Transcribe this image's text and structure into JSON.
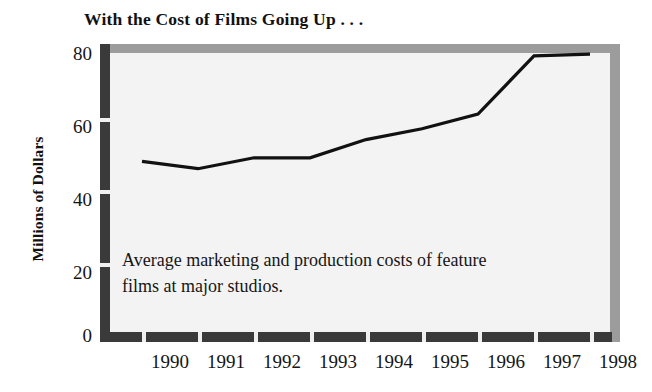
{
  "title": "With the Cost of Films Going Up . . .",
  "axis": {
    "y_title": "Millions of Dollars",
    "y_ticks": [
      "0",
      "20",
      "40",
      "60",
      "80"
    ],
    "x_ticks": [
      "1990",
      "1991",
      "1992",
      "1993",
      "1994",
      "1995",
      "1996",
      "1997",
      "1998"
    ]
  },
  "annotation": {
    "line1": "Average marketing and production costs of feature",
    "line2": "films at major studios."
  },
  "colors": {
    "line": "#111111",
    "axis_bar": "#3a3a3a",
    "frame_shadow": "#9c9c9c",
    "plot_background": "#f3f3f3",
    "page_background": "#ffffff",
    "text": "#151515"
  },
  "chart_data": {
    "type": "line",
    "title": "With the Cost of Films Going Up . . .",
    "subtitle": "Average marketing and production costs of feature films at major studios.",
    "xlabel": "",
    "ylabel": "Millions of Dollars",
    "x": [
      "1990",
      "1991",
      "1992",
      "1993",
      "1994",
      "1995",
      "1996",
      "1997",
      "1998"
    ],
    "series": [
      {
        "name": "Average marketing and production costs per feature film",
        "values": [
          48,
          46,
          49,
          49,
          54,
          57,
          61,
          77,
          77.5
        ]
      }
    ],
    "ylim": [
      0,
      80
    ],
    "yticks": [
      0,
      20,
      40,
      60,
      80
    ],
    "grid": false,
    "legend": "none",
    "units": "Millions of Dollars"
  }
}
